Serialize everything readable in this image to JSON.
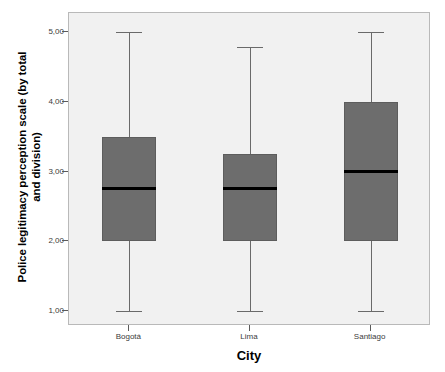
{
  "chart_data": {
    "type": "box",
    "title": "",
    "xlabel": "City",
    "ylabel": "Police legitimacy perception scale (by total and division)",
    "ylabel_line1": "Police legitimacy perception scale (by total",
    "ylabel_line2": "and division)",
    "categories": [
      "Bogotá",
      "Lima",
      "Santiago"
    ],
    "ylim": [
      1.0,
      5.0
    ],
    "ytick_values": [
      1.0,
      2.0,
      3.0,
      4.0,
      5.0
    ],
    "ytick_labels": [
      "1,00",
      "2,00",
      "3,00",
      "4,00",
      "5,00"
    ],
    "grid": false,
    "legend": "none",
    "box_fill_color": "#6d6d6d",
    "median_color": "#000000",
    "whisker_color": "#6a6a6a",
    "plot_background_color": "#f1f1f1",
    "frame_color": "#b9b9b9",
    "boxes": [
      {
        "category": "Bogotá",
        "whisker_low": 1.0,
        "q1": 2.0,
        "median": 2.75,
        "q3": 3.5,
        "whisker_high": 5.0,
        "outliers": []
      },
      {
        "category": "Lima",
        "whisker_low": 1.0,
        "q1": 2.0,
        "median": 2.75,
        "q3": 3.25,
        "whisker_high": 4.78,
        "outliers": []
      },
      {
        "category": "Santiago",
        "whisker_low": 1.0,
        "q1": 2.0,
        "median": 3.0,
        "q3": 4.0,
        "whisker_high": 5.0,
        "outliers": []
      }
    ]
  }
}
